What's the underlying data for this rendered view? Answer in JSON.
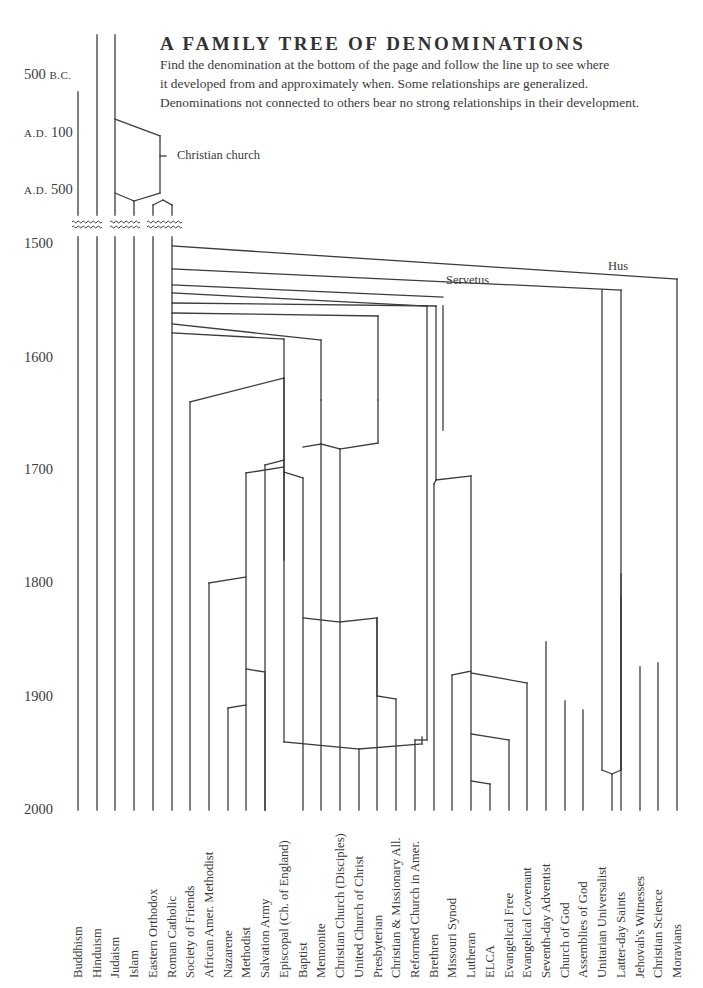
{
  "header": {
    "title": "A FAMILY TREE OF DENOMINATIONS",
    "subtitle_lines": [
      "Find the denomination at the bottom of the page and follow the line up to see where",
      "it developed from and approximately when. Some relationships are generalized.",
      "Denominations not connected to others bear no strong relationships in their development."
    ]
  },
  "axis": {
    "labels": [
      {
        "text": "500",
        "era": "B.C.",
        "y": 75
      },
      {
        "text": "100",
        "era": "A.D.",
        "y": 133
      },
      {
        "text": "500",
        "era": "A.D.",
        "y": 190
      },
      {
        "text": "1500",
        "y": 244
      },
      {
        "text": "1600",
        "y": 358
      },
      {
        "text": "1700",
        "y": 470
      },
      {
        "text": "1800",
        "y": 583
      },
      {
        "text": "1900",
        "y": 697
      },
      {
        "text": "2000",
        "y": 810
      }
    ]
  },
  "annotations": {
    "christian_church": "Christian church",
    "servetus": "Servetus",
    "hus": "Hus"
  },
  "denominations": [
    "Buddhism",
    "Hinduism",
    "Judaism",
    "Islam",
    "Eastern Orthodox",
    "Roman Catholic",
    "Society of Friends",
    "African Amer. Methodist",
    "Nazarene",
    "Methodist",
    "Salvation Army",
    "Episcopal (Ch. of England)",
    "Baptist",
    "Mennonite",
    "Christian Church (Disciples)",
    "United Church of Christ",
    "Presbyterian",
    "Christian & Missionary All.",
    "Reformed Church in Amer.",
    "Brethren",
    "Missouri Synod",
    "Lutheran",
    "ELCA",
    "Evangelical Free",
    "Evangelical Covenant",
    "Seventh-day Adventist",
    "Church of God",
    "Assemblies of God",
    "Unitarian Universalist",
    "Latter-day Saints",
    "Jehovah's Witnesses",
    "Christian Science",
    "Moravians"
  ],
  "colors": {
    "line": "#3c3c3c",
    "text": "#3a3a3a",
    "background": "#ffffff"
  },
  "tree_segments": [
    [
      78,
      92,
      78,
      215
    ],
    [
      97,
      35,
      97,
      215
    ],
    [
      115,
      35,
      115,
      215
    ],
    [
      115,
      119,
      160,
      136
    ],
    [
      160,
      136,
      160,
      193
    ],
    [
      160,
      156,
      166,
      156
    ],
    [
      115,
      193,
      134,
      201
    ],
    [
      134,
      201,
      160,
      193
    ],
    [
      134,
      201,
      134,
      215
    ],
    [
      153,
      215,
      153,
      205
    ],
    [
      153,
      205,
      163,
      200
    ],
    [
      163,
      200,
      172,
      205
    ],
    [
      172,
      205,
      172,
      215
    ],
    [
      78,
      237,
      78,
      810
    ],
    [
      97,
      237,
      97,
      810
    ],
    [
      115,
      237,
      115,
      810
    ],
    [
      134,
      237,
      134,
      810
    ],
    [
      153,
      237,
      153,
      810
    ],
    [
      172,
      237,
      172,
      810
    ],
    [
      172,
      246,
      677,
      279
    ],
    [
      677,
      279,
      677,
      810
    ],
    [
      172,
      269,
      621,
      290
    ],
    [
      172,
      285,
      443,
      297
    ],
    [
      172,
      293,
      427,
      306
    ],
    [
      172,
      303,
      436,
      306
    ],
    [
      172,
      313,
      378,
      316
    ],
    [
      378,
      316,
      378,
      400
    ],
    [
      172,
      324,
      321,
      340
    ],
    [
      321,
      340,
      321,
      400
    ],
    [
      172,
      333,
      284,
      339
    ],
    [
      284,
      339,
      284,
      560
    ],
    [
      602,
      290,
      602,
      770
    ],
    [
      602,
      770,
      612,
      774
    ],
    [
      612,
      774,
      612,
      810
    ],
    [
      621,
      290,
      621,
      770
    ],
    [
      621,
      770,
      612,
      774
    ],
    [
      621,
      598,
      621,
      770
    ],
    [
      436,
      306,
      436,
      480
    ],
    [
      443,
      306,
      443,
      430
    ],
    [
      427,
      306,
      427,
      740
    ],
    [
      427,
      740,
      415,
      740
    ],
    [
      415,
      740,
      415,
      810
    ],
    [
      190,
      402,
      284,
      378
    ],
    [
      190,
      402,
      190,
      810
    ],
    [
      284,
      378,
      284,
      460
    ],
    [
      284,
      460,
      265,
      465
    ],
    [
      265,
      465,
      265,
      810
    ],
    [
      246,
      473,
      284,
      467
    ],
    [
      246,
      473,
      246,
      810
    ],
    [
      209,
      583,
      246,
      577
    ],
    [
      209,
      583,
      209,
      810
    ],
    [
      284,
      460,
      284,
      475
    ],
    [
      284,
      472,
      303,
      478
    ],
    [
      303,
      478,
      303,
      810
    ],
    [
      284,
      472,
      284,
      742
    ],
    [
      284,
      742,
      359,
      749
    ],
    [
      321,
      400,
      321,
      444
    ],
    [
      321,
      444,
      303,
      447
    ],
    [
      321,
      444,
      340,
      449
    ],
    [
      340,
      449,
      340,
      810
    ],
    [
      321,
      444,
      321,
      810
    ],
    [
      378,
      400,
      378,
      443
    ],
    [
      378,
      443,
      340,
      449
    ],
    [
      228,
      708,
      246,
      705
    ],
    [
      228,
      708,
      228,
      810
    ],
    [
      246,
      669,
      265,
      672
    ],
    [
      265,
      672,
      265,
      810
    ],
    [
      303,
      618,
      340,
      622
    ],
    [
      340,
      622,
      377,
      618
    ],
    [
      377,
      618,
      377,
      696
    ],
    [
      377,
      696,
      396,
      699
    ],
    [
      396,
      699,
      396,
      810
    ],
    [
      377,
      618,
      377,
      810
    ],
    [
      359,
      749,
      359,
      810
    ],
    [
      359,
      749,
      422,
      744
    ],
    [
      422,
      744,
      422,
      737
    ],
    [
      436,
      480,
      434,
      484
    ],
    [
      434,
      484,
      434,
      810
    ],
    [
      436,
      480,
      471,
      476
    ],
    [
      471,
      476,
      471,
      810
    ],
    [
      471,
      671,
      452,
      675
    ],
    [
      452,
      675,
      452,
      810
    ],
    [
      471,
      673,
      527,
      683
    ],
    [
      527,
      683,
      527,
      810
    ],
    [
      471,
      734,
      509,
      740
    ],
    [
      509,
      740,
      509,
      810
    ],
    [
      471,
      781,
      490,
      784
    ],
    [
      490,
      784,
      490,
      810
    ],
    [
      546,
      642,
      546,
      810
    ],
    [
      565,
      701,
      565,
      810
    ],
    [
      583,
      710,
      583,
      810
    ],
    [
      640,
      667,
      640,
      810
    ],
    [
      658,
      663,
      658,
      810
    ],
    [
      621,
      574,
      621,
      810
    ]
  ]
}
